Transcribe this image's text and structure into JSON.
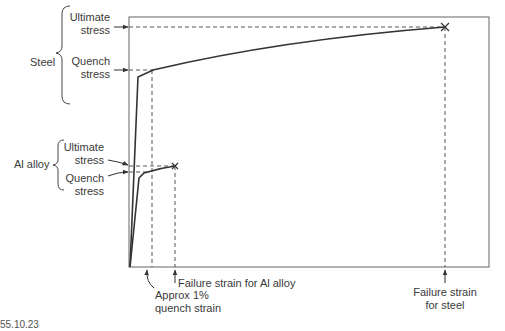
{
  "diagram": {
    "type": "stress-strain comparison",
    "materials": [
      {
        "name": "Steel",
        "ultimate_stress_label": "Ultimate stress",
        "quench_stress_label": "Quench stress",
        "failure_strain_label": "Failure strain for steel"
      },
      {
        "name": "Al alloy",
        "ultimate_stress_label": "Ultimate stress",
        "quench_stress_label": "Quench stress",
        "failure_strain_label": "Failure strain for Al alloy"
      }
    ],
    "quench_strain_label": "Approx 1% quench strain",
    "failure_marker": "×"
  },
  "labels": {
    "steel": "Steel",
    "steel_ultimate_1": "Ultimate",
    "steel_ultimate_2": "stress",
    "steel_quench_1": "Quench",
    "steel_quench_2": "stress",
    "al": "Al alloy",
    "al_ultimate_1": "Ultimate",
    "al_ultimate_2": "stress",
    "al_quench_1": "Quench",
    "al_quench_2": "stress",
    "quench_strain_1": "Approx 1%",
    "quench_strain_2": "quench strain",
    "al_failure": "Failure strain for Al alloy",
    "steel_failure_1": "Failure strain",
    "steel_failure_2": "for steel",
    "figure_id": "55.10.23"
  },
  "colors": {
    "curve": "#333333",
    "axes": "#555555",
    "dashed": "#555555",
    "text": "#3a3a3a"
  }
}
